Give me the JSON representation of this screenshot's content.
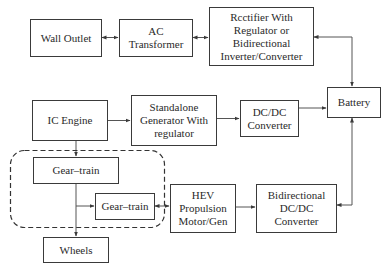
{
  "diagram": {
    "type": "block-diagram",
    "nodes": [
      {
        "id": "wall_outlet",
        "label": "Wall Outlet"
      },
      {
        "id": "ac_transformer",
        "label": "AC\nTransformer"
      },
      {
        "id": "rectifier",
        "label": "Rcctifier With\nRegulator or\nBidirectional\nInverter/Converter"
      },
      {
        "id": "battery",
        "label": "Battery"
      },
      {
        "id": "ic_engine",
        "label": "IC Engine"
      },
      {
        "id": "standalone_generator",
        "label": "Standalone\nGenerator With\nregulator"
      },
      {
        "id": "dcdc_converter",
        "label": "DC/DC\nConverter"
      },
      {
        "id": "gear_train_1",
        "label": "Gear–train"
      },
      {
        "id": "gear_train_2",
        "label": "Gear–train"
      },
      {
        "id": "hev_motor",
        "label": "HEV\nPropulsion\nMotor/Gen"
      },
      {
        "id": "bidir_dcdc",
        "label": "Bidirectional\nDC/DC\nConverter"
      },
      {
        "id": "wheels",
        "label": "Wheels"
      }
    ],
    "edges": [
      {
        "from": "wall_outlet",
        "to": "ac_transformer",
        "bidirectional": true
      },
      {
        "from": "ac_transformer",
        "to": "rectifier",
        "bidirectional": true
      },
      {
        "from": "rectifier",
        "to": "battery",
        "bidirectional": true
      },
      {
        "from": "ic_engine",
        "to": "standalone_generator",
        "bidirectional": false
      },
      {
        "from": "standalone_generator",
        "to": "dcdc_converter",
        "bidirectional": false
      },
      {
        "from": "dcdc_converter",
        "to": "battery",
        "bidirectional": false
      },
      {
        "from": "ic_engine",
        "to": "gear_train_1",
        "bidirectional": false
      },
      {
        "from": "gear_train_1",
        "to": "gear_train_2",
        "bidirectional": false
      },
      {
        "from": "gear_train_1",
        "to": "wheels",
        "bidirectional": false
      },
      {
        "from": "gear_train_2",
        "to": "hev_motor",
        "bidirectional": true
      },
      {
        "from": "hev_motor",
        "to": "bidir_dcdc",
        "bidirectional": false
      },
      {
        "from": "battery",
        "to": "bidir_dcdc",
        "bidirectional": true
      }
    ],
    "groups": [
      {
        "id": "gear_group",
        "style": "dashed-rounded",
        "contains": [
          "gear_train_1",
          "gear_train_2"
        ]
      }
    ]
  }
}
